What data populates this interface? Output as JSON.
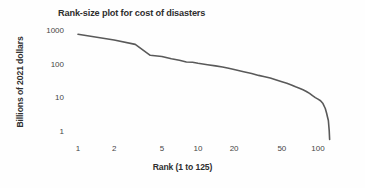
{
  "chart_data": {
    "type": "line",
    "title": "Rank-size plot for cost of disasters",
    "xlabel": "Rank (1 to 125)",
    "ylabel": "Billions of 2021 dollars",
    "xscale": "log",
    "yscale": "log",
    "grid": false,
    "legend": null,
    "xlim": [
      1,
      125
    ],
    "ylim": [
      0.5,
      1100
    ],
    "xticks": [
      1,
      2,
      5,
      10,
      20,
      50,
      100
    ],
    "xtick_labels": [
      "1",
      "2",
      "5",
      "10",
      "20",
      "50",
      "100"
    ],
    "yticks": [
      1,
      10,
      100,
      1000
    ],
    "ytick_labels": [
      "1",
      "10",
      "100",
      "1000"
    ],
    "series": [
      {
        "name": "cost of disasters",
        "color": "#595959",
        "x": [
          1,
          2,
          3,
          4,
          5,
          6,
          7,
          8,
          9,
          10,
          12,
          14,
          16,
          18,
          20,
          24,
          28,
          32,
          36,
          40,
          45,
          50,
          55,
          60,
          65,
          70,
          75,
          80,
          85,
          90,
          95,
          100,
          105,
          110,
          115,
          118,
          120,
          122,
          124,
          125
        ],
        "y": [
          800,
          540,
          400,
          190,
          175,
          150,
          135,
          120,
          118,
          110,
          100,
          92,
          85,
          78,
          72,
          62,
          55,
          48,
          44,
          40,
          35,
          31,
          28,
          25,
          22,
          20,
          18,
          16,
          14,
          12,
          10.5,
          9.5,
          8.5,
          7.0,
          5.0,
          3.6,
          2.8,
          2.2,
          1.1,
          0.6
        ]
      }
    ]
  },
  "axis_positions": {
    "note": "pixel anchors used for log mapping",
    "x_rank1_px": 78,
    "x_rank100_px": 318,
    "y_1000_px": 31,
    "y_1_px": 132
  }
}
